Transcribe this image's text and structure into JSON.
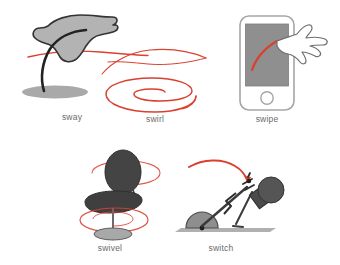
{
  "figure": {
    "background_color": "#ffffff",
    "accent_color": "#d94030",
    "ink_color": "#3b3b3b",
    "fill_gray": "#b3b3b3",
    "dark_gray": "#4a4a4a",
    "caption_color": "#6b6b6b",
    "layout": "two rows; three panels on top, two panels on bottom"
  },
  "panels": [
    {
      "id": "sway",
      "label": "sway",
      "row": 1,
      "column": 1,
      "description": "A gray leaf or flag blob on a dark curved stem, rooted in an elliptical ground shadow, with a thin red motion arc sweeping through it",
      "icon_name": "sway-leaf-icon",
      "motion_line_color": "#d94030",
      "shape_fill": "#b3b3b3",
      "shadow_fill": "#9a9a9a"
    },
    {
      "id": "swirl",
      "label": "swirl",
      "row": 1,
      "column": 2,
      "description": "A flat red elliptical spiral with a long sweeping ribbon curve arcing above it",
      "icon_name": "swirl-spiral-icon",
      "motion_line_color": "#d94030",
      "turns": 2
    },
    {
      "id": "swipe",
      "label": "swipe",
      "row": 1,
      "column": 3,
      "description": "A smartphone with a gray screen and round home button; an outlined pointing hand drags a red arc across the display",
      "icon_name": "swipe-phone-icon",
      "motion_line_color": "#d94030",
      "screen_fill": "#8f8f8f",
      "body_outline": "#9a9a9a"
    },
    {
      "id": "swivel",
      "label": "swivel",
      "row": 2,
      "column": 1,
      "description": "A dark gray office chair with an oval backrest, seat, center post and disc base, encircled by red rotation spirals",
      "icon_name": "swivel-chair-icon",
      "motion_line_color": "#d94030",
      "chair_fill": "#4a4a4a",
      "base_fill": "#a8a8a8"
    },
    {
      "id": "switch",
      "label": "switch",
      "row": 2,
      "column": 2,
      "description": "A mechanical lever linkage with a gray half-disc wheel on a ground plane, zigzag spring element and round knob, with a red arc arrow showing the throw direction",
      "icon_name": "switch-lever-icon",
      "motion_line_color": "#d94030",
      "wheel_fill": "#8e8e8e",
      "linkage_color": "#3b3b3b"
    }
  ]
}
